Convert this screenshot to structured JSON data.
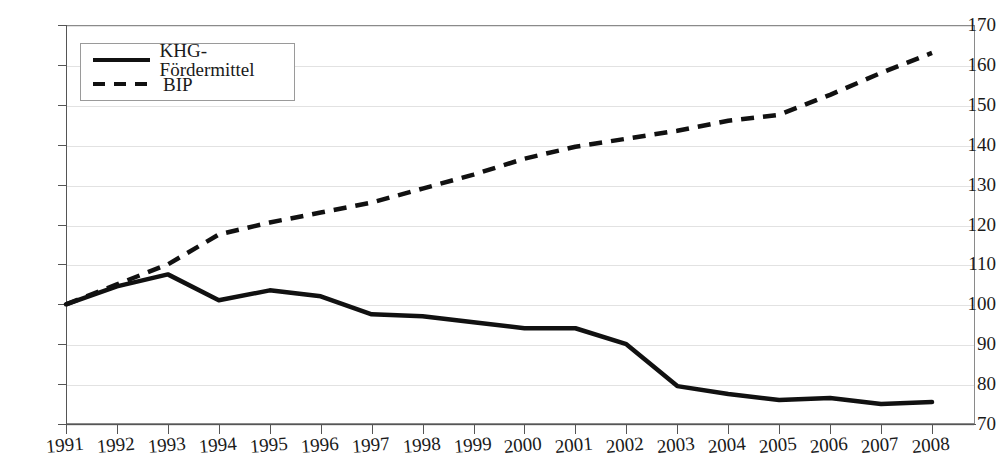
{
  "chart_data": {
    "type": "line",
    "title": "",
    "subtitle": "",
    "xlabel": "",
    "ylabel": "",
    "grid": true,
    "legend_position": "top-left",
    "x": [
      "1991",
      "1992",
      "1993",
      "1994",
      "1995",
      "1996",
      "1997",
      "1998",
      "1999",
      "2000",
      "2001",
      "2002",
      "2003",
      "2004",
      "2005",
      "2006",
      "2007",
      "2008"
    ],
    "categories": [
      "1991",
      "1992",
      "1993",
      "1994",
      "1995",
      "1996",
      "1997",
      "1998",
      "1999",
      "2000",
      "2001",
      "2002",
      "2003",
      "2004",
      "2005",
      "2006",
      "2007",
      "2008"
    ],
    "ylim": [
      70,
      170
    ],
    "yticks": [
      70,
      80,
      90,
      100,
      110,
      120,
      130,
      140,
      150,
      160,
      170
    ],
    "ytick_labels": [
      "70",
      "80",
      "90",
      "100",
      "110",
      "120",
      "130",
      "140",
      "150",
      "160",
      "170"
    ],
    "series": [
      {
        "name": "KHG-Fördermittel",
        "style": "solid",
        "color": "#111111",
        "values": [
          100.0,
          104.5,
          107.5,
          101.0,
          103.5,
          102.0,
          97.5,
          97.0,
          95.5,
          94.0,
          94.0,
          90.0,
          79.5,
          77.5,
          76.0,
          76.5,
          75.0,
          75.5
        ]
      },
      {
        "name": "BIP",
        "style": "dashed",
        "color": "#111111",
        "values": [
          100.0,
          105.0,
          110.0,
          117.5,
          120.5,
          123.0,
          125.5,
          129.0,
          132.5,
          136.5,
          139.5,
          141.5,
          143.5,
          146.0,
          147.5,
          152.5,
          158.0,
          163.0
        ]
      }
    ]
  },
  "legend": {
    "entries": [
      {
        "label": "KHG-Fördermittel",
        "style": "solid"
      },
      {
        "label": "BIP",
        "style": "dashed"
      }
    ]
  }
}
